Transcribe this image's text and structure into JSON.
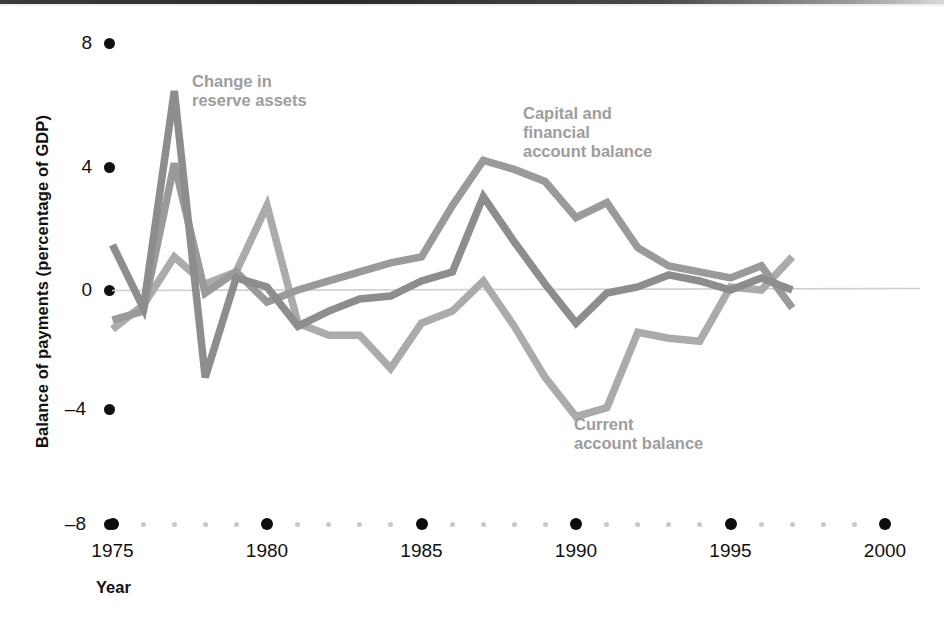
{
  "axes": {
    "ylabel": "Balance of payments (percentage of GDP)",
    "xlabel": "Year",
    "yticks": [
      "8",
      "4",
      "0",
      "–4",
      "–8"
    ],
    "xticks": [
      "1975",
      "1980",
      "1985",
      "1990",
      "1995",
      "2000"
    ]
  },
  "annotations": {
    "reserve": "Change in\nreserve assets",
    "reserve_line1": "Change in",
    "reserve_line2": "reserve assets",
    "capital_line1": "Capital and",
    "capital_line2": "financial",
    "capital_line3": "account balance",
    "current_line1": "Current",
    "current_line2": "account balance"
  },
  "colors": {
    "series_dark": "#8d8d8d",
    "series_mid": "#9a9a9a",
    "series_light": "#ababab",
    "label_gray": "#9d9d9d",
    "axis_black": "#111111",
    "zero_line": "#cfcfcf",
    "minor_dot": "#c9c9c9"
  },
  "chart_data": {
    "type": "line",
    "title": "",
    "xlabel": "Year",
    "ylabel": "Balance of payments (percentage of GDP)",
    "xlim": [
      1975,
      2000
    ],
    "ylim": [
      -8,
      8
    ],
    "ytick_values": [
      8,
      4,
      0,
      -4,
      -8
    ],
    "xtick_values": [
      1975,
      1980,
      1985,
      1990,
      1995,
      2000
    ],
    "grid": false,
    "legend": "inline-annotations",
    "x": [
      1975,
      1976,
      1977,
      1978,
      1979,
      1980,
      1981,
      1982,
      1983,
      1984,
      1985,
      1986,
      1987,
      1988,
      1989,
      1990,
      1991,
      1992,
      1993,
      1994,
      1995,
      1996,
      1997
    ],
    "series": [
      {
        "name": "Change in reserve assets",
        "color": "#8d8d8d",
        "values": [
          1.5,
          -0.6,
          6.6,
          -2.9,
          0.4,
          0.1,
          -1.2,
          -0.7,
          -0.3,
          -0.2,
          0.3,
          0.6,
          3.1,
          1.6,
          0.2,
          -1.1,
          -0.1,
          0.1,
          0.5,
          0.3,
          0.0,
          0.4,
          0.0
        ]
      },
      {
        "name": "Capital and financial account balance",
        "color": "#9a9a9a",
        "values": [
          -1.0,
          -0.7,
          4.2,
          -0.1,
          0.6,
          -0.4,
          0.0,
          0.3,
          0.6,
          0.9,
          1.1,
          2.8,
          4.3,
          4.0,
          3.6,
          2.4,
          2.9,
          1.4,
          0.8,
          0.6,
          0.4,
          0.8,
          -0.6
        ]
      },
      {
        "name": "Current account balance",
        "color": "#ababab",
        "values": [
          -1.3,
          -0.5,
          1.1,
          0.2,
          0.6,
          2.8,
          -1.1,
          -1.5,
          -1.5,
          -2.6,
          -1.1,
          -0.7,
          0.3,
          -1.2,
          -2.9,
          -4.2,
          -3.9,
          -1.4,
          -1.6,
          -1.7,
          0.1,
          0.0,
          1.1
        ]
      }
    ]
  }
}
